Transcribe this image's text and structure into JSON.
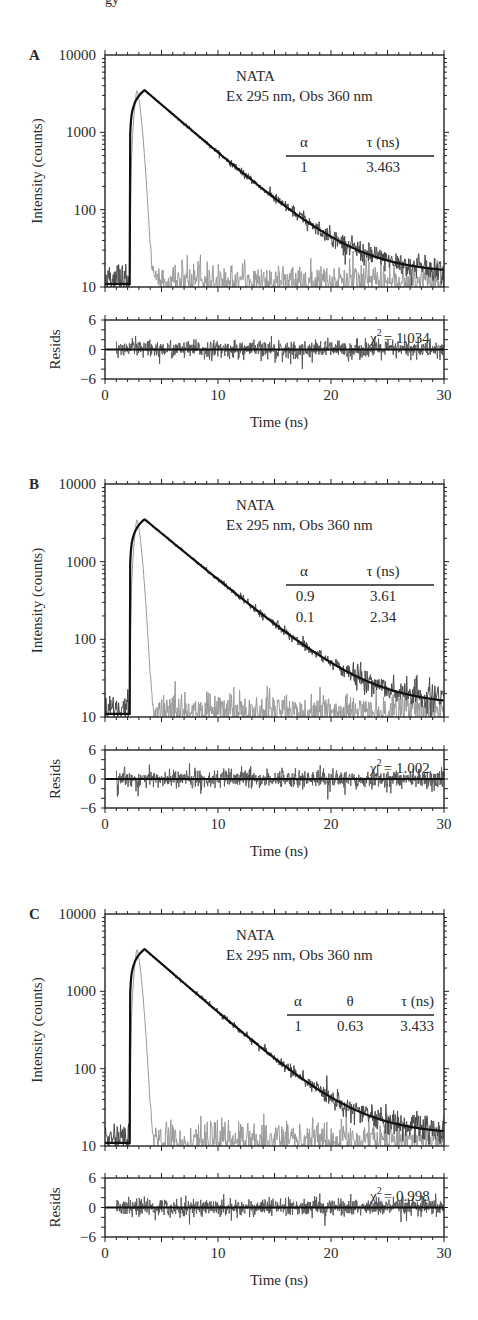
{
  "page_header_fragment": "gy",
  "chart_data": [
    {
      "panel": "A",
      "type": "line",
      "title": "NATA",
      "subtitle": "Ex 295 nm, Obs 360 nm",
      "xlabel": "Time (ns)",
      "ylabel": "Intensity (counts)",
      "yscale": "log",
      "ylim": [
        10,
        10000
      ],
      "xlim": [
        0,
        30
      ],
      "yticks": [
        "10",
        "100",
        "1000",
        "10000"
      ],
      "xticks": [
        "0",
        "10",
        "20",
        "30"
      ],
      "series": [
        {
          "name": "IRF (lamp)",
          "color": "#9a9a9a",
          "rise_ns": 2.2,
          "peak_ns": 2.8,
          "peak_counts": 3500,
          "baseline": 12
        },
        {
          "name": "Decay data",
          "color": "#4a4a4a",
          "rise_ns": 2.2,
          "peak_ns": 3.5,
          "peak_counts": 3500,
          "baseline": 15
        },
        {
          "name": "Fit",
          "color": "#111111"
        }
      ],
      "table": {
        "headers": [
          "α",
          "τ (ns)"
        ],
        "rows": [
          [
            "1",
            "3.463"
          ]
        ]
      },
      "residuals": {
        "ylabel": "Resids",
        "ylim": [
          -6,
          6
        ],
        "yticks": [
          "6",
          "0",
          "−6"
        ],
        "chi2_label": "χ",
        "chi2_value": "= 1.034"
      }
    },
    {
      "panel": "B",
      "type": "line",
      "title": "NATA",
      "subtitle": "Ex 295 nm, Obs 360 nm",
      "xlabel": "Time (ns)",
      "ylabel": "Intensity (counts)",
      "yscale": "log",
      "ylim": [
        10,
        10000
      ],
      "xlim": [
        0,
        30
      ],
      "yticks": [
        "10",
        "100",
        "1000",
        "10000"
      ],
      "xticks": [
        "0",
        "10",
        "20",
        "30"
      ],
      "series": [
        {
          "name": "IRF (lamp)",
          "color": "#9a9a9a",
          "rise_ns": 2.2,
          "peak_ns": 2.8,
          "peak_counts": 3500,
          "baseline": 12
        },
        {
          "name": "Decay data",
          "color": "#4a4a4a",
          "rise_ns": 2.2,
          "peak_ns": 3.5,
          "peak_counts": 3500,
          "baseline": 14
        },
        {
          "name": "Fit",
          "color": "#111111"
        }
      ],
      "table": {
        "headers": [
          "α",
          "τ (ns)"
        ],
        "rows": [
          [
            "0.9",
            "3.61"
          ],
          [
            "0.1",
            "2.34"
          ]
        ]
      },
      "residuals": {
        "ylabel": "Resids",
        "ylim": [
          -6,
          6
        ],
        "yticks": [
          "6",
          "0",
          "−6"
        ],
        "chi2_label": "χ",
        "chi2_value": "= 1.002"
      }
    },
    {
      "panel": "C",
      "type": "line",
      "title": "NATA",
      "subtitle": "Ex 295 nm, Obs 360 nm",
      "xlabel": "Time (ns)",
      "ylabel": "Intensity (counts)",
      "yscale": "log",
      "ylim": [
        10,
        10000
      ],
      "xlim": [
        0,
        30
      ],
      "yticks": [
        "10",
        "100",
        "1000",
        "10000"
      ],
      "xticks": [
        "0",
        "10",
        "20",
        "30"
      ],
      "series": [
        {
          "name": "IRF (lamp)",
          "color": "#9a9a9a",
          "rise_ns": 2.2,
          "peak_ns": 2.8,
          "peak_counts": 3500,
          "baseline": 12
        },
        {
          "name": "Decay data",
          "color": "#4a4a4a",
          "rise_ns": 2.2,
          "peak_ns": 3.5,
          "peak_counts": 3500,
          "baseline": 14
        },
        {
          "name": "Fit",
          "color": "#111111"
        }
      ],
      "table": {
        "headers": [
          "α",
          "θ",
          "τ (ns)"
        ],
        "rows": [
          [
            "1",
            "0.63",
            "3.433"
          ]
        ]
      },
      "residuals": {
        "ylabel": "Resids",
        "ylim": [
          -6,
          6
        ],
        "yticks": [
          "6",
          "0",
          "−6"
        ],
        "chi2_label": "χ",
        "chi2_value": "= 0.998"
      }
    }
  ]
}
